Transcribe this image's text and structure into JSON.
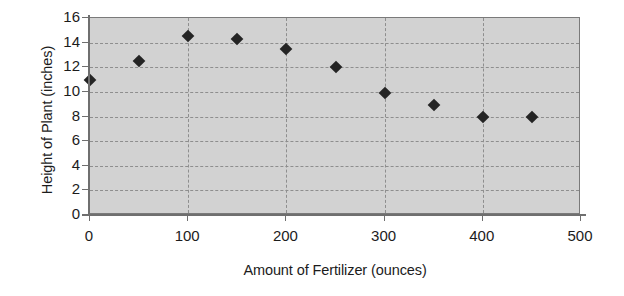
{
  "chart_data": {
    "type": "scatter",
    "title": "",
    "xlabel": "Amount of Fertilizer (ounces)",
    "ylabel": "Height of Plant (inches)",
    "xlim": [
      0,
      500
    ],
    "ylim": [
      0,
      16
    ],
    "x_ticks": [
      0,
      100,
      200,
      300,
      400,
      500
    ],
    "y_ticks": [
      0,
      2,
      4,
      6,
      8,
      10,
      12,
      14,
      16
    ],
    "x_tick_labels": [
      "0",
      "100",
      "200",
      "300",
      "400",
      "500"
    ],
    "y_tick_labels": [
      "0",
      "2",
      "4",
      "6",
      "8",
      "10",
      "12",
      "14",
      "16"
    ],
    "grid": true,
    "grid_style": "dashed",
    "legend": false,
    "legend_position": "none",
    "plot_background": "#d2d2d2",
    "marker_shape": "diamond",
    "marker_color": "#242424",
    "x": [
      0,
      50,
      100,
      150,
      200,
      250,
      300,
      350,
      400,
      450
    ],
    "values": [
      11.0,
      12.5,
      14.5,
      14.3,
      13.5,
      12.0,
      9.9,
      8.9,
      8.0,
      8.0
    ],
    "points": [
      {
        "x": 0,
        "y": 11.0
      },
      {
        "x": 50,
        "y": 12.5
      },
      {
        "x": 100,
        "y": 14.5
      },
      {
        "x": 150,
        "y": 14.3
      },
      {
        "x": 200,
        "y": 13.5
      },
      {
        "x": 250,
        "y": 12.0
      },
      {
        "x": 300,
        "y": 9.9
      },
      {
        "x": 350,
        "y": 8.9
      },
      {
        "x": 400,
        "y": 8.0
      },
      {
        "x": 450,
        "y": 8.0
      }
    ]
  }
}
